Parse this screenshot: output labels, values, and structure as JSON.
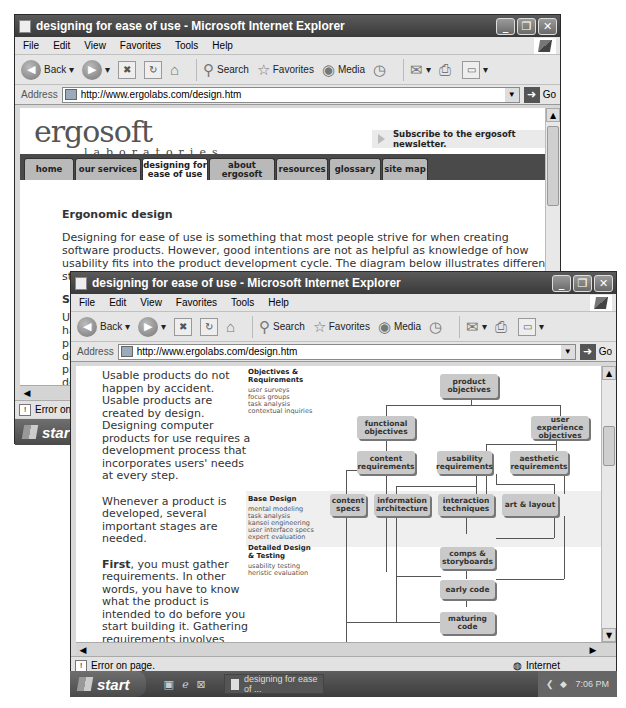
{
  "back_window": {
    "title": "designing for ease of use - Microsoft Internet Explorer",
    "menu": [
      "File",
      "Edit",
      "View",
      "Favorites",
      "Tools",
      "Help"
    ],
    "toolbar": {
      "back": "Back",
      "search": "Search",
      "favorites": "Favorites",
      "media": "Media"
    },
    "address_label": "Address",
    "url": "http://www.ergolabs.com/design.htm",
    "go": "Go",
    "page": {
      "logo": "ergosoft",
      "logo_sub": "laboratories",
      "newsletter": "Subscribe to the ergosoft newsletter.",
      "nav": [
        "home",
        "our services",
        "designing for ease of use",
        "about ergosoft",
        "resources",
        "glossary",
        "site map"
      ],
      "heading": "Ergonomic design",
      "body": "Designing for ease of use is something that most people strive for when creating software products. However, good intentions are not as helpful as knowledge of how usability fits into the product development cycle. The diagram below illustrates different stages of the development process and when different techniques come into play.",
      "partial_heading": "Stag",
      "partial_lines": [
        "Usab",
        "happ",
        "prod",
        "desig",
        "prod",
        "deve",
        "incor",
        "every"
      ]
    },
    "status": "Error on pa",
    "start": "start"
  },
  "front_window": {
    "title": "designing for ease of use - Microsoft Internet Explorer",
    "menu": [
      "File",
      "Edit",
      "View",
      "Favorites",
      "Tools",
      "Help"
    ],
    "toolbar": {
      "back": "Back",
      "search": "Search",
      "favorites": "Favorites",
      "media": "Media"
    },
    "address_label": "Address",
    "url": "http://www.ergolabs.com/design.htm",
    "go": "Go",
    "intro": [
      "Usable products do not happen by accident. Usable products are created by design. Designing computer products for use requires a development process that incorporates users' needs at every step.",
      "Whenever a product is developed, several important stages are needed."
    ],
    "first_bold": "First",
    "first_rest": ", you must gather requirements. In other words, you have to know what the product is intended to do before you start building it. Gathering requirements involves defining two things:",
    "bullet": "• the end-users' needs that must be met by the product",
    "stages": [
      {
        "title": "Objectives & Requirements",
        "items": "user surveys\nfocus groups\ntask analysis\ncontextual inquiries"
      },
      {
        "title": "Base Design",
        "items": "mental modeling\ntask analysis\nkansei engineering\nuser interface specs\nexpert evaluation"
      },
      {
        "title": "Detailed Design & Testing",
        "items": "usability testing\nheristic evaluation"
      }
    ],
    "diagram": {
      "product_objectives": "product objectives",
      "functional_objectives": "functional objectives",
      "ux_objectives": "user experience objectives",
      "content_requirements": "content requirements",
      "usability_requirements": "usability requirements",
      "aesthetic_requirements": "aesthetic requirements",
      "content_specs": "content specs",
      "information_architecture": "information architecture",
      "interaction_techniques": "interaction techniques",
      "art_layout": "art & layout",
      "comps_storyboards": "comps & storyboards",
      "early_code": "early code",
      "maturing_code": "maturing code"
    },
    "status": "Error on page.",
    "zone": "Internet"
  },
  "taskbar": {
    "start": "start",
    "task": "designing for ease of ...",
    "clock": "7:06 PM"
  }
}
